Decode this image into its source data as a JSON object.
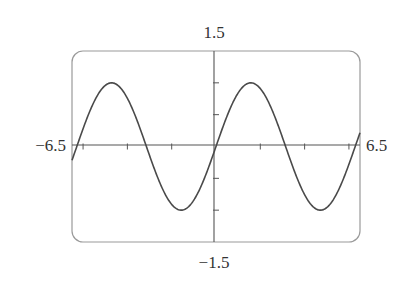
{
  "chart_data": {
    "type": "line",
    "title": "",
    "function": "y = sin(x)",
    "xlabel": "",
    "ylabel": "",
    "xlim": [
      -6.5,
      6.5
    ],
    "ylim": [
      -1.5,
      1.5
    ],
    "x_tick_labels": {
      "min": "−6.5",
      "max": "6.5"
    },
    "y_tick_labels": {
      "min": "−1.5",
      "max": "1.5"
    },
    "x_ticks": [
      -6,
      -4,
      -2,
      2,
      4,
      6
    ],
    "y_ticks": [
      -1,
      -0.5,
      0.5,
      1
    ],
    "grid": false,
    "legend": null,
    "series": [
      {
        "name": "sin(x)",
        "sample_points": [
          [
            -6.5,
            -0.215
          ],
          [
            -4.712,
            1.0
          ],
          [
            -3.1416,
            0.0
          ],
          [
            -1.5708,
            -1.0
          ],
          [
            0.0,
            0.0
          ],
          [
            1.5708,
            1.0
          ],
          [
            3.1416,
            0.0
          ],
          [
            4.712,
            -1.0
          ],
          [
            6.5,
            0.215
          ]
        ]
      }
    ]
  },
  "colors": {
    "curve": "#4a4a4a",
    "axes": "#555555",
    "frame": "#9a9a9a",
    "text": "#333333"
  }
}
